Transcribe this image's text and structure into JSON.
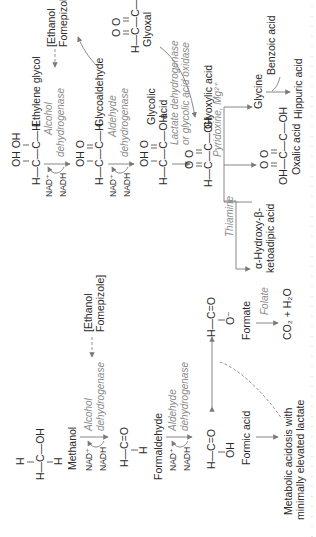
{
  "orientation": "rotated-90-ccw",
  "colors": {
    "text": "#2a2a2a",
    "enzyme_text": "#8a8a8a",
    "arrow": "#7a7a7a",
    "background": "#ffffff"
  },
  "methanol_pathway": {
    "methanol": {
      "label": "Methanol",
      "structure": {
        "top": "H",
        "middle": "H—C—OH",
        "bottom": "H"
      }
    },
    "step1": {
      "cofactor_in": "NAD⁺",
      "cofactor_out": "NADH",
      "enzyme_line1": "Alcohol",
      "enzyme_line2": "dehydrogenase",
      "inhibitor_line1": "[Ethanol",
      "inhibitor_line2": "Fomepizole]"
    },
    "formaldehyde": {
      "label": "Formaldehyde",
      "structure": {
        "middle": "H—C=O",
        "bottom": "H"
      }
    },
    "step2": {
      "cofactor_in": "NAD⁺",
      "cofactor_out": "NADH",
      "enzyme_line1": "Aldehyde",
      "enzyme_line2": "dehydrogenase"
    },
    "formic_acid": {
      "label": "Formic acid",
      "structure": {
        "middle": "H—C=O",
        "bottom": "OH"
      }
    },
    "formate": {
      "label": "Formate",
      "structure": {
        "middle": "H—C=O",
        "bottom": "O⁻"
      }
    },
    "folate_step": {
      "cofactor": "Folate",
      "product": "CO₂ + H₂O"
    },
    "outcome": {
      "line1": "Metabolic acidosis with",
      "line2": "minimally elevated lactate"
    }
  },
  "ethylene_glycol_pathway": {
    "ethylene_glycol": {
      "label": "Ethylene glycol",
      "structure": {
        "top": "OH OH",
        "middle": "H—C—C—H"
      }
    },
    "step1": {
      "cofactor_in": "NAD⁺",
      "cofactor_out": "NADH",
      "enzyme_line1": "Alcohol",
      "enzyme_line2": "dehydrogenase",
      "inhibitor_line1": "[Ethanol",
      "inhibitor_line2": "Fomepizole]"
    },
    "glycoaldehyde": {
      "label": "Glycoaldehyde",
      "structure": {
        "top": "OH O",
        "middle": "H—C—C—H"
      }
    },
    "step2": {
      "cofactor_in": "NAD⁺",
      "cofactor_out": "NADH",
      "enzyme_line1": "Aldehyde",
      "enzyme_line2": "dehydrogenase"
    },
    "glycolic_acid": {
      "label_line1": "Glycolic",
      "label_line2": "acid",
      "structure": {
        "top": "OH O",
        "middle": "H—C—C—OH"
      }
    },
    "glyoxal": {
      "label": "Glyoxal",
      "structure": {
        "top": "O  O",
        "middle": "H—C—C—H"
      }
    },
    "step3": {
      "enzyme_line1": "Lactate dehydrogenase",
      "enzyme_line2": "or glycolic acid oxidase"
    },
    "glyoxylic_acid": {
      "label": "Glyoxylic acid",
      "structure": {
        "top": "O  O",
        "middle": "H—C—C—OH"
      }
    },
    "pyridoxine_step": {
      "cofactor": "Pyridoxine, Mg²⁺",
      "product": "Glycine"
    },
    "benzoic_step": {
      "cofactor": "Benzoic acid",
      "product": "Hippuric acid"
    },
    "oxalic_acid": {
      "label": "Oxalic acid",
      "structure": {
        "top": "O  O",
        "middle": "OH—C—C—OH"
      }
    },
    "thiamine_step": {
      "cofactor": "Thiamine",
      "product_line1": "α-Hydroxy-β-",
      "product_line2": "ketoadipic acid"
    }
  }
}
